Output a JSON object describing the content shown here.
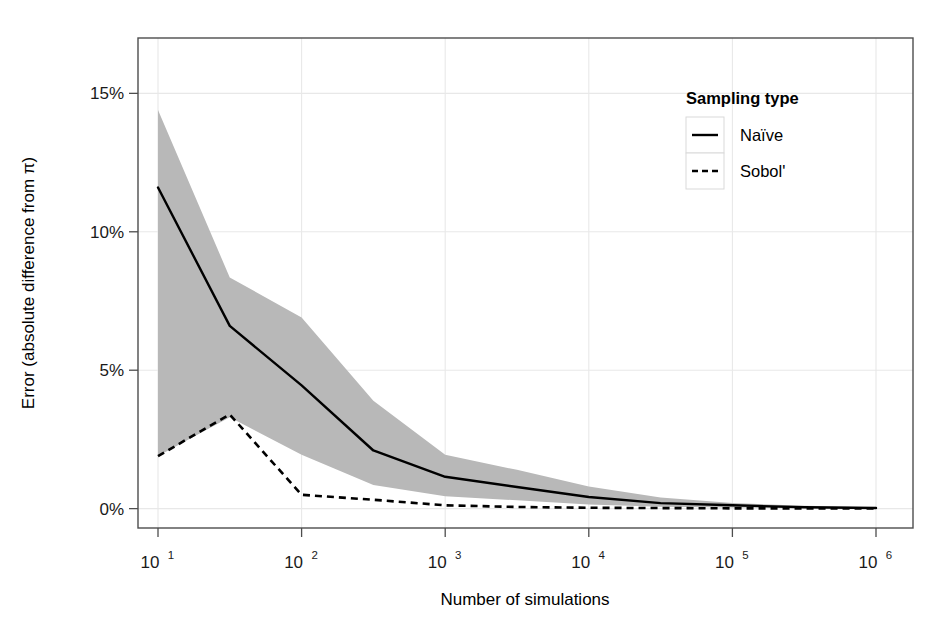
{
  "chart_data": {
    "type": "line",
    "title": "",
    "xlabel": "Number of simulations",
    "ylabel": "Error (absolute difference from π)",
    "xscale": "log10",
    "xlim": [
      10,
      1000000
    ],
    "ylim": [
      -0.7,
      17.0
    ],
    "grid": true,
    "x": [
      10,
      31.6,
      100,
      316,
      1000,
      3160,
      10000,
      31600,
      100000,
      316000,
      1000000
    ],
    "x_tick_labels": [
      "10¹",
      "10²",
      "10³",
      "10⁴",
      "10⁵",
      "10⁶"
    ],
    "x_tick_bases": [
      "10",
      "10",
      "10",
      "10",
      "10",
      "10"
    ],
    "x_tick_exponents": [
      "1",
      "2",
      "3",
      "4",
      "5",
      "6"
    ],
    "x_tick_values": [
      10,
      100,
      1000,
      10000,
      100000,
      1000000
    ],
    "y_tick_labels": [
      "0%",
      "5%",
      "10%",
      "15%"
    ],
    "y_tick_values": [
      0,
      5,
      10,
      15
    ],
    "series": [
      {
        "name": "Naïve",
        "style": "solid",
        "color": "#000000",
        "values": [
          11.6,
          6.6,
          4.45,
          2.1,
          1.15,
          0.78,
          0.42,
          0.2,
          0.12,
          0.05,
          0.02
        ]
      },
      {
        "name": "Sobol'",
        "style": "dashed",
        "color": "#000000",
        "values": [
          1.9,
          3.4,
          0.5,
          0.32,
          0.12,
          0.06,
          0.03,
          0.02,
          0.01,
          0.01,
          0.01
        ]
      }
    ],
    "ribbon": {
      "name": "Naïve spread",
      "color": "#b8b8b8",
      "upper": [
        14.4,
        8.35,
        6.9,
        3.9,
        1.95,
        1.4,
        0.8,
        0.4,
        0.2,
        0.1,
        0.05
      ],
      "lower": [
        1.9,
        3.3,
        1.95,
        0.85,
        0.45,
        0.3,
        0.15,
        0.07,
        0.04,
        0.02,
        0.0
      ]
    },
    "legend": {
      "title": "Sampling type",
      "position": "top-right-inside",
      "entries": [
        {
          "label": "Naïve",
          "style": "solid"
        },
        {
          "label": "Sobol'",
          "style": "dashed"
        }
      ]
    }
  },
  "axes": {
    "x_title": "Number of simulations",
    "y_title": "Error (absolute difference from π)"
  },
  "legend": {
    "title": "Sampling type",
    "item0_label": "Naïve",
    "item1_label": "Sobol'"
  },
  "y_ticks": {
    "t0": "0%",
    "t1": "5%",
    "t2": "10%",
    "t3": "15%"
  },
  "x_ticks": {
    "b0": "10",
    "e0": "1",
    "b1": "10",
    "e1": "2",
    "b2": "10",
    "e2": "3",
    "b3": "10",
    "e3": "4",
    "b4": "10",
    "e4": "5",
    "b5": "10",
    "e5": "6"
  },
  "colors": {
    "ribbon": "#b8b8b8",
    "line": "#000000",
    "grid": "#e8e8e8",
    "panel_border": "#4d4d4d",
    "background": "#ffffff"
  }
}
